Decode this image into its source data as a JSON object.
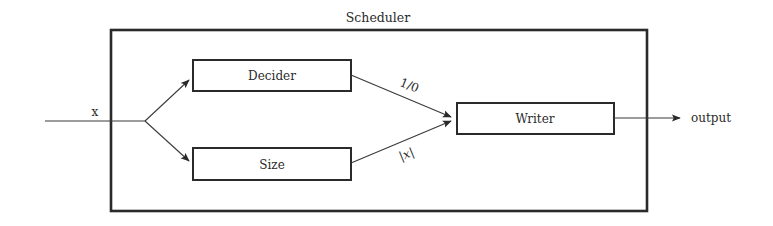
{
  "diagram": {
    "container": {
      "label": "Scheduler"
    },
    "input": {
      "label": "x"
    },
    "output": {
      "label": "output"
    },
    "blocks": [
      {
        "id": "decider",
        "label": "Decider"
      },
      {
        "id": "size",
        "label": "Size"
      },
      {
        "id": "writer",
        "label": "Writer"
      }
    ],
    "edges": [
      {
        "from": "input",
        "to": "decider",
        "label": ""
      },
      {
        "from": "input",
        "to": "size",
        "label": ""
      },
      {
        "from": "decider",
        "to": "writer",
        "label": "1/0"
      },
      {
        "from": "size",
        "to": "writer",
        "label": "|x|"
      },
      {
        "from": "writer",
        "to": "output",
        "label": ""
      }
    ]
  }
}
